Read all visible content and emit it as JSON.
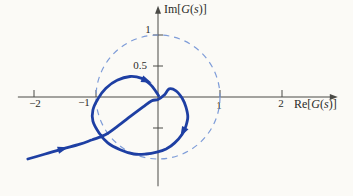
{
  "figure": {
    "background": "#fbfaf6",
    "type_note": "Nyquist diagram with unit circle"
  },
  "chart_data": {
    "type": "line",
    "title": "",
    "xlabel": "Re[G(s)]",
    "ylabel": "Im[G(s)]",
    "xlabel_parts": [
      {
        "t": "Re[",
        "i": false
      },
      {
        "t": "G",
        "i": true
      },
      {
        "t": "(",
        "i": false
      },
      {
        "t": "s",
        "i": true
      },
      {
        "t": ")]",
        "i": false
      }
    ],
    "ylabel_parts": [
      {
        "t": "Im[",
        "i": false
      },
      {
        "t": "G",
        "i": true
      },
      {
        "t": "(",
        "i": false
      },
      {
        "t": "s",
        "i": true
      },
      {
        "t": ")]",
        "i": false
      }
    ],
    "xlim": [
      -2.26,
      2.9
    ],
    "ylim": [
      -1.44,
      1.47
    ],
    "grid": false,
    "axes_color": "#4a4a46",
    "x_ticks": [
      {
        "value": -2,
        "label": "−2",
        "label_x": 35,
        "label_y": 107
      },
      {
        "value": -1,
        "label": "−1",
        "label_x": 84,
        "label_y": 106
      },
      {
        "value": 1,
        "label": "1",
        "label_x": 219,
        "label_y": 109
      },
      {
        "value": 2,
        "label": "2",
        "label_x": 281,
        "label_y": 107
      }
    ],
    "y_ticks": [
      {
        "value": 1,
        "label": "1",
        "label_x": 148,
        "label_y": 33
      },
      {
        "value": 0.5,
        "label": "0.5",
        "label_x": 140,
        "label_y": 69
      },
      {
        "value": -0.5,
        "label": "",
        "label_x": 0,
        "label_y": 0
      }
    ],
    "unit_circle": {
      "center": [
        0,
        0
      ],
      "radius": 1,
      "style": "dashed",
      "color": "#7e9cd8",
      "dash": "6 5",
      "width": 1.2
    },
    "nyquist_curve": {
      "color": "#1e3fa3",
      "width": 2.8,
      "points": [
        [
          -2.1,
          -1.0
        ],
        [
          -1.82,
          -0.92
        ],
        [
          -1.55,
          -0.84
        ],
        [
          -1.26,
          -0.76
        ],
        [
          -1.06,
          -0.69
        ],
        [
          -0.85,
          -0.61
        ],
        [
          -0.65,
          -0.47
        ],
        [
          -0.44,
          -0.31
        ],
        [
          -0.24,
          -0.16
        ],
        [
          -0.1,
          -0.06
        ],
        [
          0.0,
          -0.04
        ],
        [
          0.1,
          0.03
        ],
        [
          0.18,
          0.13
        ],
        [
          0.29,
          0.1
        ],
        [
          0.39,
          -0.02
        ],
        [
          0.45,
          -0.16
        ],
        [
          0.48,
          -0.32
        ],
        [
          0.45,
          -0.47
        ],
        [
          0.39,
          -0.6
        ],
        [
          0.27,
          -0.74
        ],
        [
          0.13,
          -0.84
        ],
        [
          -0.02,
          -0.89
        ],
        [
          -0.19,
          -0.92
        ],
        [
          -0.39,
          -0.92
        ],
        [
          -0.61,
          -0.85
        ],
        [
          -0.81,
          -0.74
        ],
        [
          -0.95,
          -0.58
        ],
        [
          -1.05,
          -0.39
        ],
        [
          -1.05,
          -0.21
        ],
        [
          -0.97,
          -0.03
        ],
        [
          -0.84,
          0.14
        ],
        [
          -0.66,
          0.27
        ],
        [
          -0.45,
          0.33
        ],
        [
          -0.26,
          0.3
        ],
        [
          -0.13,
          0.21
        ],
        [
          -0.04,
          0.1
        ],
        [
          0.01,
          0.02
        ]
      ]
    },
    "direction_arrows": [
      {
        "re": -1.55,
        "im": -0.84,
        "angle_deg": -16
      },
      {
        "re": -0.2,
        "im": 0.27,
        "angle_deg": 22
      },
      {
        "re": 0.41,
        "im": -0.55,
        "angle_deg": 118
      }
    ],
    "pixel_mapping": {
      "origin_px": [
        158,
        97
      ],
      "px_per_unit": 62,
      "canvas": [
        353,
        196
      ]
    }
  }
}
